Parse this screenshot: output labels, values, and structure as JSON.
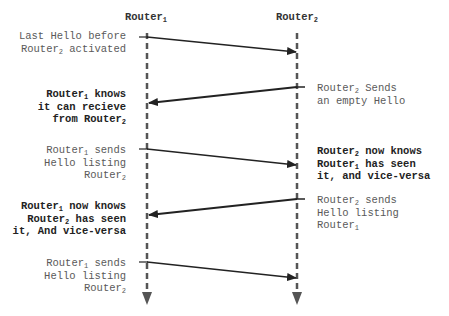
{
  "diagram": {
    "type": "sequence",
    "colors": {
      "lifeline": "#555555",
      "message": "#222222",
      "text_plain": "#5a5a5a",
      "text_bold": "#222222"
    },
    "participants": [
      {
        "name": "Router",
        "sub": "1"
      },
      {
        "name": "Router",
        "sub": "2"
      }
    ],
    "messages": [
      {
        "from": "Router1",
        "to": "Router2",
        "style": "thin",
        "order": 1
      },
      {
        "from": "Router2",
        "to": "Router1",
        "style": "thick",
        "order": 2
      },
      {
        "from": "Router1",
        "to": "Router2",
        "style": "thin",
        "order": 3
      },
      {
        "from": "Router2",
        "to": "Router1",
        "style": "thick",
        "order": 4
      },
      {
        "from": "Router1",
        "to": "Router2",
        "style": "thin",
        "order": 5
      }
    ],
    "notes": {
      "n1": {
        "side": "left",
        "weight": "normal",
        "l1": "Last Hello before",
        "l2a": "Router",
        "l2s": "2",
        "l2b": " activated"
      },
      "n2": {
        "side": "right",
        "weight": "normal",
        "l1a": "Router",
        "l1s": "2",
        "l1b": " Sends",
        "l2": "an empty Hello"
      },
      "n3": {
        "side": "left",
        "weight": "bold",
        "l1a": "Router",
        "l1s": "1",
        "l1b": " knows",
        "l2": "it can recieve",
        "l3a": "from Router",
        "l3s": "2"
      },
      "n4": {
        "side": "left",
        "weight": "normal",
        "l1a": "Router",
        "l1s": "1",
        "l1b": " sends",
        "l2": "Hello listing",
        "l3a": "Router",
        "l3s": "2"
      },
      "n5": {
        "side": "right",
        "weight": "bold",
        "l1a": "Router",
        "l1s": "2",
        "l1b": " now knows",
        "l2a": "Router",
        "l2s": "1",
        "l2b": " has seen",
        "l3": "it, and vice-versa"
      },
      "n6": {
        "side": "right",
        "weight": "normal",
        "l1a": "Router",
        "l1s": "2",
        "l1b": " sends",
        "l2": "Hello listing",
        "l3a": "Router",
        "l3s": "1"
      },
      "n7": {
        "side": "left",
        "weight": "bold",
        "l1a": "Router",
        "l1s": "1",
        "l1b": " now knows",
        "l2a": "Router",
        "l2s": "2",
        "l2b": " has seen",
        "l3": "it, And vice-versa"
      },
      "n8": {
        "side": "left",
        "weight": "normal",
        "l1a": "Router",
        "l1s": "1",
        "l1b": " sends",
        "l2": "Hello listing",
        "l3a": "Router",
        "l3s": "2"
      }
    }
  }
}
